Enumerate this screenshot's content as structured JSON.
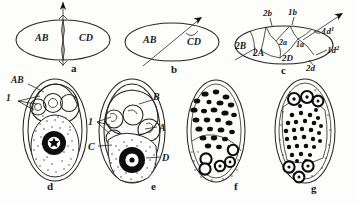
{
  "figure": {
    "background_color": "#fdfdfc",
    "ink_color": "#1a1a1a"
  },
  "panels": [
    {
      "id": "a",
      "letter": "a",
      "letter_x": 71,
      "letter_y": 72,
      "caption": "Two-cell stage, frontal view, vertical cleavage plane",
      "labels": [
        {
          "text": "AB",
          "x": 35,
          "y": 41
        },
        {
          "text": "CD",
          "x": 79,
          "y": 41
        }
      ]
    },
    {
      "id": "b",
      "letter": "b",
      "letter_x": 171,
      "letter_y": 73,
      "caption": "Two-cell stage with oblique (spiral) cleavage plane",
      "labels": [
        {
          "text": "AB",
          "x": 143,
          "y": 43
        },
        {
          "text": "CD",
          "x": 187,
          "y": 44
        }
      ]
    },
    {
      "id": "c",
      "letter": "c",
      "letter_x": 281,
      "letter_y": 73,
      "caption": "Multicellular stage with named micromeres and macromeres",
      "labels": [
        {
          "text": "2b",
          "x": 269,
          "y": 24
        },
        {
          "text": "1b",
          "x": 293,
          "y": 23
        },
        {
          "text": "2B",
          "x": 240,
          "y": 48
        },
        {
          "text": "2A",
          "x": 258,
          "y": 54
        },
        {
          "text": "2a",
          "x": 285,
          "y": 46
        },
        {
          "text": "1a",
          "x": 301,
          "y": 48
        },
        {
          "text": "2D",
          "x": 288,
          "y": 60
        },
        {
          "text": "2d",
          "x": 311,
          "y": 70
        },
        {
          "text": "1d1",
          "x": 325,
          "y": 33,
          "display": "1d",
          "superscript": "1"
        },
        {
          "text": "1d2",
          "x": 330,
          "y": 52,
          "display": "1d",
          "superscript": "2"
        }
      ]
    },
    {
      "id": "d",
      "letter": "d",
      "letter_x": 47,
      "letter_y": 188,
      "caption": "Embryo in egg capsule: two micromeres and one large yolky macromere",
      "labels": [
        {
          "text": "AB",
          "x": 13,
          "y": 82
        },
        {
          "text": "1",
          "x": 5,
          "y": 99
        }
      ]
    },
    {
      "id": "e",
      "letter": "e",
      "letter_x": 152,
      "letter_y": 188,
      "caption": "Four-cell stage A, B, C, D with first quartet micromeres",
      "labels": [
        {
          "text": "B",
          "x": 155,
          "y": 97
        },
        {
          "text": "1",
          "x": 87,
          "y": 122
        },
        {
          "text": "A",
          "x": 160,
          "y": 127
        },
        {
          "text": "C",
          "x": 88,
          "y": 146
        },
        {
          "text": "D",
          "x": 163,
          "y": 158
        }
      ]
    },
    {
      "id": "f",
      "letter": "f",
      "letter_x": 234,
      "letter_y": 188,
      "caption": "Later embryo: cluster of dark blastomeres above, ring cells in stippled yolk below",
      "labels": []
    },
    {
      "id": "g",
      "letter": "g",
      "letter_x": 311,
      "letter_y": 190,
      "caption": "Advanced embryo: ring cells at animal and vegetal poles, dense dark cell mass in centre",
      "labels": []
    }
  ],
  "legend_terms": [
    "AB",
    "CD",
    "A",
    "B",
    "C",
    "D",
    "1a",
    "1b",
    "1d1",
    "1d2",
    "2a",
    "2b",
    "2d",
    "2A",
    "2B",
    "2D",
    "1"
  ]
}
